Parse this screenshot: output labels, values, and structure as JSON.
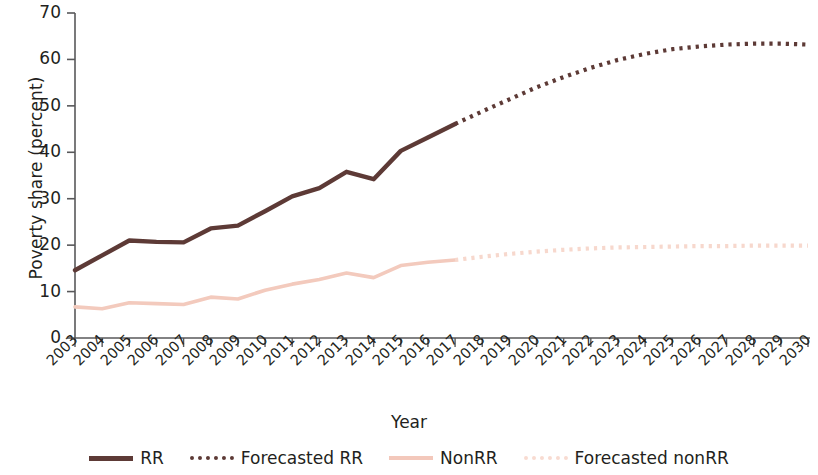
{
  "chart_data": {
    "type": "line",
    "title": "",
    "xlabel": "Year",
    "ylabel": "Poverty share (percent)",
    "xlim": [
      2003,
      2030
    ],
    "ylim": [
      0,
      70
    ],
    "yticks": [
      0,
      10,
      20,
      30,
      40,
      50,
      60,
      70
    ],
    "grid": false,
    "legend_position": "bottom",
    "x": [
      2003,
      2004,
      2005,
      2006,
      2007,
      2008,
      2009,
      2010,
      2011,
      2012,
      2013,
      2014,
      2015,
      2016,
      2017,
      2018,
      2019,
      2020,
      2021,
      2022,
      2023,
      2024,
      2025,
      2026,
      2027,
      2028,
      2029,
      2030
    ],
    "categories": [
      "2003",
      "2004",
      "2005",
      "2006",
      "2007",
      "2008",
      "2009",
      "2010",
      "2011",
      "2012",
      "2013",
      "2014",
      "2015",
      "2016",
      "2017",
      "2018",
      "2019",
      "2020",
      "2021",
      "2022",
      "2023",
      "2024",
      "2025",
      "2026",
      "2027",
      "2028",
      "2029",
      "2030"
    ],
    "series": [
      {
        "name": "RR",
        "style": "solid",
        "color": "#5d3a36",
        "x": [
          2003,
          2004,
          2005,
          2006,
          2007,
          2008,
          2009,
          2010,
          2011,
          2012,
          2013,
          2014,
          2015,
          2016,
          2017
        ],
        "values": [
          14.6,
          17.8,
          21.0,
          20.7,
          20.6,
          23.6,
          24.2,
          27.3,
          30.5,
          32.3,
          35.8,
          34.2,
          40.3,
          43.2,
          46.1
        ]
      },
      {
        "name": "Forecasted RR",
        "style": "dotted",
        "color": "#5d3a36",
        "x": [
          2017,
          2018,
          2019,
          2020,
          2021,
          2022,
          2023,
          2024,
          2025,
          2026,
          2027,
          2028,
          2029,
          2030
        ],
        "values": [
          46.1,
          48.8,
          51.4,
          54.0,
          56.2,
          58.2,
          59.9,
          61.2,
          62.2,
          62.8,
          63.2,
          63.4,
          63.4,
          63.2
        ]
      },
      {
        "name": "NonRR",
        "style": "solid",
        "color": "#f3cabd",
        "x": [
          2003,
          2004,
          2005,
          2006,
          2007,
          2008,
          2009,
          2010,
          2011,
          2012,
          2013,
          2014,
          2015,
          2016,
          2017
        ],
        "values": [
          6.7,
          6.3,
          7.6,
          7.4,
          7.2,
          8.8,
          8.4,
          10.3,
          11.6,
          12.6,
          14.0,
          13.0,
          15.6,
          16.3,
          16.8
        ]
      },
      {
        "name": "Forecasted nonRR",
        "style": "dotted",
        "color": "#f7d8cd",
        "x": [
          2017,
          2018,
          2019,
          2020,
          2021,
          2022,
          2023,
          2024,
          2025,
          2026,
          2027,
          2028,
          2029,
          2030
        ],
        "values": [
          16.8,
          17.5,
          18.1,
          18.6,
          19.0,
          19.3,
          19.5,
          19.6,
          19.7,
          19.8,
          19.8,
          19.9,
          19.9,
          19.9
        ]
      }
    ]
  },
  "axes": {
    "y_title": "Poverty share (percent)",
    "x_title": "Year",
    "y_tick_labels": [
      "70",
      "60",
      "50",
      "40",
      "30",
      "20",
      "10",
      "0"
    ],
    "x_tick_labels": [
      "2003",
      "2004",
      "2005",
      "2006",
      "2007",
      "2008",
      "2009",
      "2010",
      "2011",
      "2012",
      "2013",
      "2014",
      "2015",
      "2016",
      "2017",
      "2018",
      "2019",
      "2020",
      "2021",
      "2022",
      "2023",
      "2024",
      "2025",
      "2026",
      "2027",
      "2028",
      "2029",
      "2030"
    ]
  },
  "legend": {
    "items": [
      {
        "label": "RR",
        "color": "#5d3a36",
        "style": "solid"
      },
      {
        "label": "Forecasted RR",
        "color": "#5d3a36",
        "style": "dotted"
      },
      {
        "label": "NonRR",
        "color": "#f3c8bb",
        "style": "solid"
      },
      {
        "label": "Forecasted nonRR",
        "color": "#f8dbd1",
        "style": "dotted"
      }
    ]
  },
  "colors": {
    "rr": "#5d3a36",
    "nonrr": "#f3c8bb",
    "axis": "#58585a",
    "text": "#231f20",
    "background": "#ffffff"
  }
}
